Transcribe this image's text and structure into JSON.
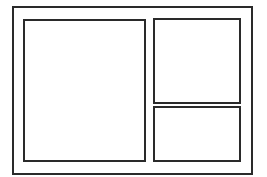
{
  "diagram": {
    "type": "wireframe-layout",
    "stroke_color": "#2a2a2a",
    "background_color": "#ffffff",
    "frame": {
      "label": "",
      "panels": [
        {
          "id": "left-panel",
          "label": ""
        },
        {
          "id": "top-right-panel",
          "label": ""
        },
        {
          "id": "bottom-right-panel",
          "label": ""
        }
      ]
    }
  }
}
